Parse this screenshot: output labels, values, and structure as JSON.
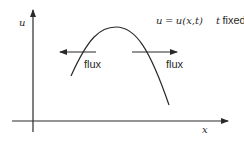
{
  "diagram": {
    "axes": {
      "y_label": "u",
      "x_label": "x"
    },
    "equation": {
      "lhs": "u",
      "equals": "=",
      "rhs": "u(x,t)",
      "condition_var": "t",
      "condition_text": "fixed"
    },
    "arrows": [
      {
        "label": "flux",
        "direction": "left"
      },
      {
        "label": "flux",
        "direction": "right"
      }
    ],
    "colors": {
      "line": "#2a2a2a",
      "background": "#ffffff"
    }
  }
}
